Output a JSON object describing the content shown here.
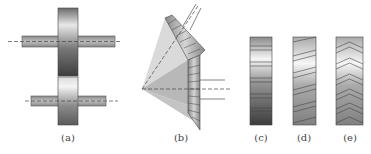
{
  "figure": {
    "panels": [
      {
        "id": "a",
        "label": "(a)",
        "content": "spur gears on parallel shafts"
      },
      {
        "id": "b",
        "label": "(b)",
        "content": "bevel gears on intersecting shafts"
      },
      {
        "id": "c",
        "label": "(c)",
        "content": "straight (spur) teeth face"
      },
      {
        "id": "d",
        "label": "(d)",
        "content": "helical teeth face"
      },
      {
        "id": "e",
        "label": "(e)",
        "content": "herringbone teeth face"
      }
    ]
  },
  "colors": {
    "gear_dark": "#555555",
    "gear_light": "#f2f2f2",
    "shaft": "#9a9a9a",
    "cone_light": "#d8d8d8",
    "cone_dark": "#b5b5b5",
    "centerline": "#555555"
  }
}
